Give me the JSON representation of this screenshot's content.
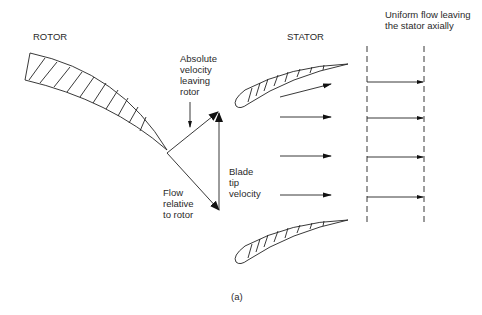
{
  "figure": {
    "caption": "(a)",
    "labels": {
      "rotor": "ROTOR",
      "stator": "STATOR",
      "uniform_flow": "Uniform flow leaving\nthe stator axially",
      "absolute_velocity": "Absolute\nvelocity\nleaving\nrotor",
      "flow_relative": "Flow\nrelative\nto rotor",
      "blade_tip_velocity": "Blade\ntip\nvelocity"
    },
    "colors": {
      "line": "#222222",
      "background": "#ffffff"
    }
  }
}
